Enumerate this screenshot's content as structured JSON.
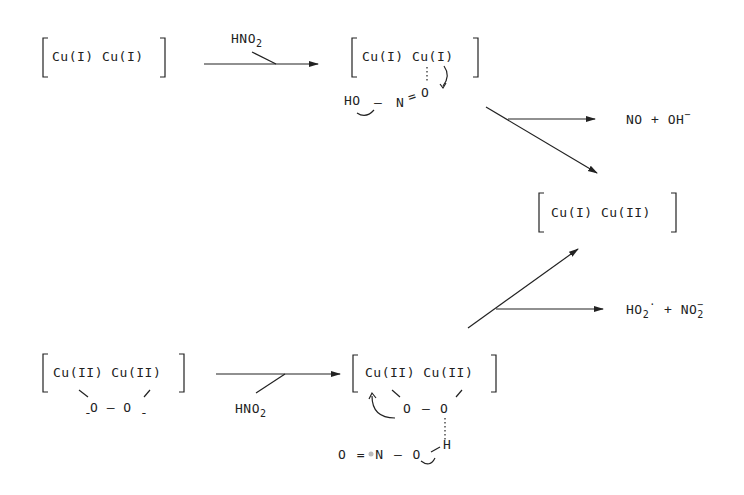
{
  "species": {
    "cu1_cu1": "Cu(I) Cu(I)",
    "cu1_cu1_intermediate": "Cu(I) Cu(I)",
    "cu1_cu2": "Cu(I) Cu(II)",
    "cu2_cu2": "Cu(II) Cu(II)",
    "cu2_cu2_intermediate": "Cu(II) Cu(II)"
  },
  "reagents": {
    "top_arrow": {
      "main": "HNO",
      "sub": "2"
    },
    "bottom_arrow": {
      "main": "HNO",
      "sub": "2"
    }
  },
  "top_intermediate": {
    "ho": "HO",
    "dash": "–",
    "n": "N",
    "double_bond": "=",
    "o": "O"
  },
  "bottom_reactant": {
    "peroxo": "O – O",
    "minus_left": "-",
    "minus_right": "-"
  },
  "bottom_intermediate": {
    "peroxo_o1": "O",
    "dash": "–",
    "peroxo_o2": "O",
    "h": "H",
    "nitrite": "O = N – O"
  },
  "products": {
    "top": {
      "a": "NO",
      "plus": "+",
      "b": "OH",
      "b_sup": "−"
    },
    "bottom": {
      "a": "HO",
      "a_sub": "2",
      "a_sup": "·",
      "plus": "+",
      "b": "NO",
      "b_sub": "2",
      "b_sup": "−"
    }
  },
  "colors": {
    "ink": "#222222",
    "background": "#ffffff"
  }
}
